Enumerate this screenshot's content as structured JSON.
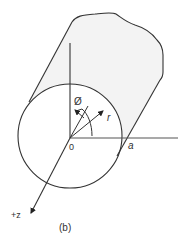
{
  "figure": {
    "caption": "(b)"
  },
  "labels": {
    "phi": "Ø",
    "r": "r",
    "origin": "0",
    "radius": "a",
    "z_axis": "+z",
    "caption": "(b)"
  },
  "colors": {
    "stroke": "#333333",
    "cylinder_fill": "#f3f3f3",
    "face_fill": "#ffffff",
    "background": "#ffffff"
  }
}
